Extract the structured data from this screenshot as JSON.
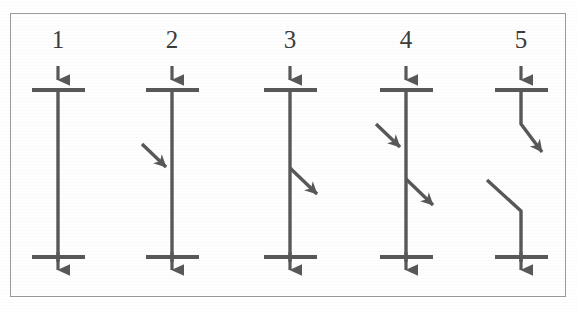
{
  "figure": {
    "caption": "",
    "background_color": "#ffffff",
    "frame_color": "#9a9a9a",
    "stroke_color": "#585858",
    "label_color": "#3c3c3c",
    "panel_count": 5
  },
  "panels": [
    {
      "label": "1",
      "label_x": 58,
      "label_y": 48,
      "name": "panel-1",
      "description": "vertical line with top and bottom electrodes, no branch arrows",
      "axis_x": 58,
      "top_bar": {
        "x1": 32,
        "x2": 85,
        "y": 90
      },
      "bottom_bar": {
        "x1": 32,
        "x2": 85,
        "y": 257
      },
      "top_arrow": {
        "x": 58,
        "y1": 66,
        "y2": 92
      },
      "bottom_arrow": {
        "x": 58,
        "y1": 250,
        "y2": 283
      },
      "trunk": {
        "x": 58,
        "y1": 88,
        "y2": 262
      },
      "in_arrow": null,
      "out_arrow": null,
      "break": null
    },
    {
      "label": "2",
      "label_x": 172,
      "label_y": 48,
      "name": "panel-2",
      "description": "vertical line with one incoming arrow from upper left",
      "axis_x": 172,
      "top_bar": {
        "x1": 146,
        "x2": 199,
        "y": 90
      },
      "bottom_bar": {
        "x1": 146,
        "x2": 199,
        "y": 257
      },
      "top_arrow": {
        "x": 172,
        "y1": 66,
        "y2": 92
      },
      "bottom_arrow": {
        "x": 172,
        "y1": 250,
        "y2": 283
      },
      "trunk": {
        "x": 172,
        "y1": 88,
        "y2": 262
      },
      "in_arrow": {
        "x1": 142,
        "y1": 144,
        "x2": 171,
        "y2": 172
      },
      "out_arrow": null,
      "break": null
    },
    {
      "label": "3",
      "label_x": 290,
      "label_y": 48,
      "name": "panel-3",
      "description": "vertical line with one outgoing arrow to lower right",
      "axis_x": 290,
      "top_bar": {
        "x1": 264,
        "x2": 317,
        "y": 90
      },
      "bottom_bar": {
        "x1": 264,
        "x2": 317,
        "y": 257
      },
      "top_arrow": {
        "x": 290,
        "y1": 66,
        "y2": 92
      },
      "bottom_arrow": {
        "x": 290,
        "y1": 250,
        "y2": 283
      },
      "trunk": {
        "x": 290,
        "y1": 88,
        "y2": 262
      },
      "in_arrow": null,
      "out_arrow": {
        "x1": 290,
        "y1": 168,
        "x2": 322,
        "y2": 199
      },
      "break": null
    },
    {
      "label": "4",
      "label_x": 406,
      "label_y": 48,
      "name": "panel-4",
      "description": "vertical line with an incoming arrow from upper left and an outgoing arrow to lower right",
      "axis_x": 406,
      "top_bar": {
        "x1": 380,
        "x2": 433,
        "y": 90
      },
      "bottom_bar": {
        "x1": 380,
        "x2": 433,
        "y": 257
      },
      "top_arrow": {
        "x": 406,
        "y1": 66,
        "y2": 92
      },
      "bottom_arrow": {
        "x": 406,
        "y1": 250,
        "y2": 283
      },
      "trunk": {
        "x": 406,
        "y1": 88,
        "y2": 262
      },
      "in_arrow": {
        "x1": 376,
        "y1": 124,
        "x2": 405,
        "y2": 152
      },
      "out_arrow": {
        "x1": 406,
        "y1": 179,
        "x2": 438,
        "y2": 209
      },
      "break": null
    },
    {
      "label": "5",
      "label_x": 521,
      "label_y": 48,
      "name": "panel-5",
      "description": "broken line: upper segment bends out to lower right arrow, separate upper left segment bends into the lower vertical segment",
      "axis_x": 521,
      "top_bar": {
        "x1": 495,
        "x2": 548,
        "y": 90
      },
      "bottom_bar": {
        "x1": 495,
        "x2": 548,
        "y": 257
      },
      "top_arrow": {
        "x": 521,
        "y1": 66,
        "y2": 92
      },
      "bottom_arrow": {
        "x": 521,
        "y1": 250,
        "y2": 283
      },
      "trunk": null,
      "in_arrow": null,
      "out_arrow": null,
      "break": {
        "upper_stem": {
          "x": 521,
          "y1": 88,
          "y2": 124
        },
        "upper_exit": {
          "x1": 521,
          "y1": 124,
          "x2": 548,
          "y2": 158
        },
        "lower_entry": {
          "x1": 487,
          "y1": 180,
          "x2": 521,
          "y2": 211
        },
        "lower_stem": {
          "x": 521,
          "y1": 211,
          "y2": 262
        }
      }
    }
  ]
}
